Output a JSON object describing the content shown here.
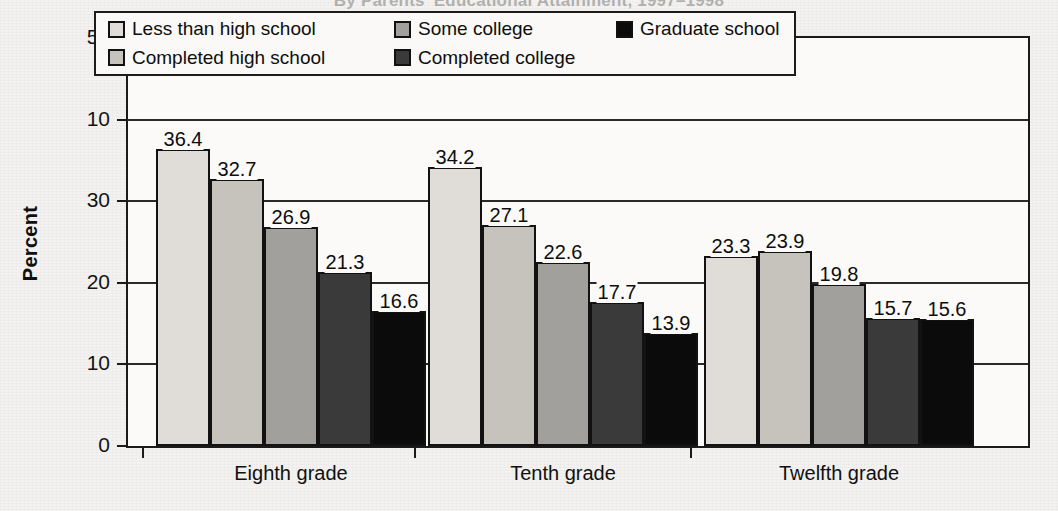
{
  "title": "By Parents' Educational Attainment, 1997–1998",
  "chart_data": {
    "type": "bar",
    "title": "By Parents' Educational Attainment, 1997–1998",
    "xlabel": "",
    "ylabel": "Percent",
    "ylim": [
      0,
      50
    ],
    "yticks": [
      "0",
      "10",
      "20",
      "30",
      "10",
      "50"
    ],
    "grid": true,
    "legend_position": "top-inside",
    "categories": [
      "Eighth grade",
      "Tenth grade",
      "Twelfth grade"
    ],
    "series": [
      {
        "name": "Less than high school",
        "color": "#e0ddd8",
        "values": [
          36.4,
          34.2,
          23.3
        ]
      },
      {
        "name": "Completed high school",
        "color": "#c6c3bd",
        "values": [
          32.7,
          27.1,
          23.9
        ]
      },
      {
        "name": "Some college",
        "color": "#a1a09c",
        "values": [
          26.9,
          22.6,
          19.8
        ]
      },
      {
        "name": "Completed college",
        "color": "#3a3a3a",
        "values": [
          21.3,
          17.7,
          15.7
        ]
      },
      {
        "name": "Graduate school",
        "color": "#0b0b0b",
        "values": [
          16.6,
          13.9,
          15.6
        ]
      }
    ],
    "labels": [
      [
        "36.4",
        "32.7",
        "26.9",
        "21.3",
        "16.6"
      ],
      [
        "34.2",
        "27.1",
        "22.6",
        "17.7",
        "13.9"
      ],
      [
        "23.3",
        "23.9",
        "19.8",
        "15.7",
        "15.6"
      ]
    ]
  },
  "legend": {
    "items": [
      {
        "label": "Less than high school",
        "swatch": "#e0ddd8"
      },
      {
        "label": "Some college",
        "swatch": "#a1a09c"
      },
      {
        "label": "Graduate school",
        "swatch": "#0b0b0b"
      },
      {
        "label": "Completed high school",
        "swatch": "#c6c3bd"
      },
      {
        "label": "Completed college",
        "swatch": "#3a3a3a"
      }
    ]
  },
  "yaxis": {
    "title": "Percent",
    "ticks": [
      {
        "text": "50",
        "value": 50
      },
      {
        "text": "10",
        "value": 40
      },
      {
        "text": "30",
        "value": 30
      },
      {
        "text": "20",
        "value": 20
      },
      {
        "text": "10",
        "value": 10
      },
      {
        "text": "0",
        "value": 0
      }
    ]
  },
  "xaxis": {
    "labels": [
      "Eighth grade",
      "Tenth grade",
      "Twelfth grade"
    ]
  }
}
